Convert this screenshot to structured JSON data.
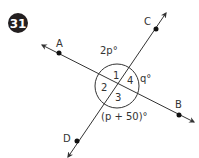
{
  "problem": {
    "number": "31",
    "badge_color": "#231f20"
  },
  "diagram": {
    "line_color": "#333333",
    "points": {
      "A": "A",
      "B": "B",
      "C": "C",
      "D": "D"
    },
    "angle_labels": {
      "top": "2p°",
      "right": "q°",
      "bottom": "(p + 50)°"
    },
    "angle_numbers": [
      "1",
      "2",
      "3",
      "4"
    ]
  }
}
